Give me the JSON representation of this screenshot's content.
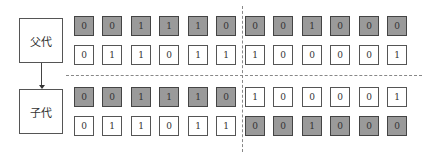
{
  "labels": {
    "parent": "父代",
    "child": "子代"
  },
  "colors": {
    "shaded": "#9a9a9a",
    "plain": "#ffffff",
    "border": "#555555",
    "dash": "#888888"
  },
  "crossover_point_after_index": 5,
  "rows": [
    {
      "group": "parent",
      "row": 1,
      "bits": [
        "0",
        "0",
        "1",
        "1",
        "1",
        "0",
        "0",
        "0",
        "1",
        "0",
        "0",
        "0"
      ],
      "shaded": [
        true,
        true,
        true,
        true,
        true,
        true,
        true,
        true,
        true,
        true,
        true,
        true
      ]
    },
    {
      "group": "parent",
      "row": 2,
      "bits": [
        "0",
        "1",
        "1",
        "0",
        "1",
        "1",
        "1",
        "0",
        "0",
        "0",
        "0",
        "1"
      ],
      "shaded": [
        false,
        false,
        false,
        false,
        false,
        false,
        false,
        false,
        false,
        false,
        false,
        false
      ]
    },
    {
      "group": "child",
      "row": 1,
      "bits": [
        "0",
        "0",
        "1",
        "1",
        "1",
        "0",
        "1",
        "0",
        "0",
        "0",
        "0",
        "1"
      ],
      "shaded": [
        true,
        true,
        true,
        true,
        true,
        true,
        false,
        false,
        false,
        false,
        false,
        false
      ]
    },
    {
      "group": "child",
      "row": 2,
      "bits": [
        "0",
        "1",
        "1",
        "0",
        "1",
        "1",
        "0",
        "0",
        "1",
        "0",
        "0",
        "0"
      ],
      "shaded": [
        false,
        false,
        false,
        false,
        false,
        false,
        true,
        true,
        true,
        true,
        true,
        true
      ]
    }
  ]
}
